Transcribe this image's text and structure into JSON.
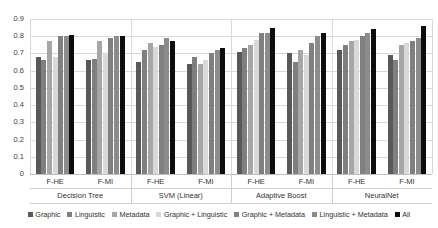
{
  "chart_data": {
    "type": "bar",
    "title": "",
    "subtitle": "",
    "xlabel": "",
    "ylabel": "",
    "ylim": [
      0,
      0.9
    ],
    "grid": true,
    "legend_position": "bottom",
    "y_ticks": [
      "0",
      "0.1",
      "0.2",
      "0.3",
      "0.4",
      "0.5",
      "0.6",
      "0.7",
      "0.8",
      "0.9"
    ],
    "y_tick_values": [
      0,
      0.1,
      0.2,
      0.3,
      0.4,
      0.5,
      0.6,
      0.7,
      0.8,
      0.9
    ],
    "groups": [
      "Decision Tree",
      "SVM (Linear)",
      "Adaptive Boost",
      "NeuralNet"
    ],
    "metrics": [
      "F-HE",
      "F-MI"
    ],
    "categories": [
      "Decision Tree / F-HE",
      "Decision Tree / F-MI",
      "SVM (Linear) / F-HE",
      "SVM (Linear) / F-MI",
      "Adaptive Boost / F-HE",
      "Adaptive Boost / F-MI",
      "NeuralNet / F-HE",
      "NeuralNet / F-MI"
    ],
    "series": [
      {
        "name": "Graphic",
        "color": "#595959",
        "values": [
          0.68,
          0.66,
          0.65,
          0.64,
          0.71,
          0.7,
          0.72,
          0.69
        ]
      },
      {
        "name": "Linguistic",
        "color": "#7f7f7f",
        "values": [
          0.66,
          0.67,
          0.72,
          0.68,
          0.73,
          0.65,
          0.75,
          0.66
        ]
      },
      {
        "name": "Metadata",
        "color": "#a6a6a6",
        "values": [
          0.77,
          0.77,
          0.76,
          0.64,
          0.75,
          0.72,
          0.77,
          0.75
        ]
      },
      {
        "name": "Graphic + Linguistic",
        "color": "#d9d9d9",
        "values": [
          0.68,
          0.7,
          0.74,
          0.66,
          0.78,
          0.69,
          0.78,
          0.76
        ]
      },
      {
        "name": "Graphic + Metadata",
        "color": "#808080",
        "values": [
          0.8,
          0.79,
          0.75,
          0.7,
          0.82,
          0.76,
          0.8,
          0.77
        ]
      },
      {
        "name": "Linguistic + Metadata",
        "color": "#8c8c8c",
        "values": [
          0.8,
          0.8,
          0.79,
          0.72,
          0.82,
          0.8,
          0.82,
          0.79
        ]
      },
      {
        "name": "All",
        "color": "#0d0d0d",
        "values": [
          0.81,
          0.8,
          0.77,
          0.73,
          0.85,
          0.82,
          0.84,
          0.86
        ]
      }
    ]
  }
}
